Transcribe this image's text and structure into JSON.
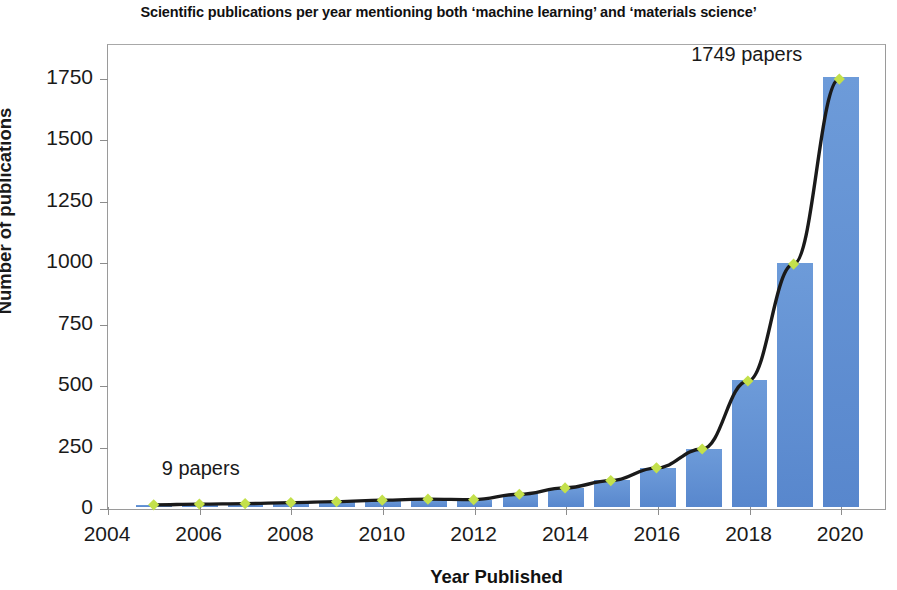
{
  "chart_data": {
    "type": "bar",
    "title": "Scientific publications per year mentioning both ‘machine learning’ and ‘materials science’",
    "xlabel": "Year Published",
    "ylabel": "Number of publications",
    "categories": [
      2005,
      2006,
      2007,
      2008,
      2009,
      2010,
      2011,
      2012,
      2013,
      2014,
      2015,
      2016,
      2017,
      2018,
      2019,
      2020
    ],
    "values": [
      9,
      12,
      14,
      18,
      22,
      28,
      32,
      30,
      52,
      78,
      108,
      160,
      237,
      515,
      993,
      1749
    ],
    "series": [
      {
        "name": "Number of publications",
        "type": "bar",
        "values": [
          9,
          12,
          14,
          18,
          22,
          28,
          32,
          30,
          52,
          78,
          108,
          160,
          237,
          515,
          993,
          1749
        ]
      },
      {
        "name": "Trend line",
        "type": "line",
        "marker": "diamond",
        "values": [
          9,
          12,
          14,
          18,
          22,
          28,
          32,
          30,
          52,
          78,
          108,
          160,
          237,
          515,
          993,
          1749
        ]
      }
    ],
    "xlim": [
      2004,
      2021
    ],
    "ylim": [
      0,
      1830
    ],
    "ytick_labels": [
      "0",
      "250",
      "500",
      "750",
      "1000",
      "1250",
      "1500",
      "1750"
    ],
    "ytick_values": [
      0,
      250,
      500,
      750,
      1000,
      1250,
      1500,
      1750
    ],
    "xtick_labels": [
      "2004",
      "2006",
      "2008",
      "2010",
      "2012",
      "2014",
      "2016",
      "2018",
      "2020"
    ],
    "xtick_values": [
      2004,
      2006,
      2008,
      2010,
      2012,
      2014,
      2016,
      2018,
      2020
    ],
    "grid": false,
    "legend": "none",
    "annotations": [
      {
        "text": "9 papers",
        "target_year": 2005,
        "target_value": 9
      },
      {
        "text": "1749 papers",
        "target_year": 2020,
        "target_value": 1749
      }
    ],
    "colors": {
      "bar": "#5c8ed2",
      "line": "#1a1a1a",
      "marker": "#c3e04b",
      "axis": "#8d8d8d",
      "text": "#1a1a1a",
      "background": "#ffffff"
    }
  },
  "annotations": {
    "low": "9 papers",
    "high": "1749 papers"
  }
}
